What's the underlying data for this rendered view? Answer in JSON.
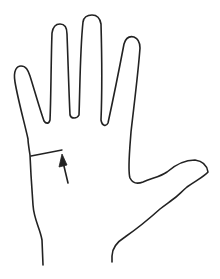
{
  "figure": {
    "annotations": [
      {
        "type": "line",
        "label": "wrist crease marker"
      },
      {
        "type": "arrow",
        "label": "arrow pointing to marker"
      }
    ],
    "colors": {
      "background": "#ffffff",
      "stroke": "#222222"
    },
    "stroke_width": 1.6
  }
}
